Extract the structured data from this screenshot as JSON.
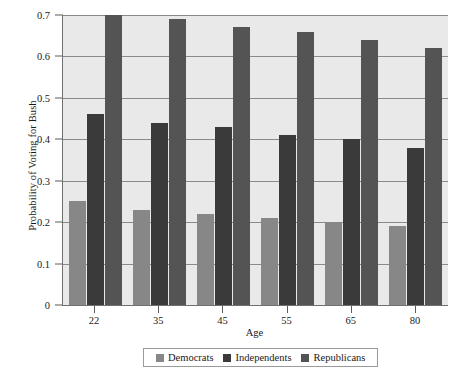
{
  "chart_data": {
    "type": "bar",
    "title": "",
    "subtitle": "",
    "xlabel": "Age",
    "ylabel": "Probability of Voting for Bush",
    "categories": [
      "22",
      "35",
      "45",
      "55",
      "65",
      "80"
    ],
    "series": [
      {
        "name": "Democrats",
        "color": "#878787",
        "values": [
          0.25,
          0.23,
          0.22,
          0.21,
          0.2,
          0.19
        ]
      },
      {
        "name": "Independents",
        "color": "#3a3a3a",
        "values": [
          0.46,
          0.44,
          0.43,
          0.41,
          0.4,
          0.38
        ]
      },
      {
        "name": "Republicans",
        "color": "#545454",
        "values": [
          0.7,
          0.69,
          0.67,
          0.66,
          0.64,
          0.62
        ]
      }
    ],
    "ylim": [
      0,
      0.7
    ],
    "yticks": [
      "0",
      "0.1",
      "0.2",
      "0.3",
      "0.4",
      "0.5",
      "0.6",
      "0.7"
    ],
    "ytick_values": [
      0,
      0.1,
      0.2,
      0.3,
      0.4,
      0.5,
      0.6,
      0.7
    ],
    "grid": true,
    "grid_axis": "y",
    "legend_position": "bottom",
    "legend_entries": [
      "Democrats",
      "Independents",
      "Republicans"
    ],
    "plot_background": "#e9e9e9",
    "axis_color": "#707070",
    "gridline_color": "#8a8a8a"
  }
}
